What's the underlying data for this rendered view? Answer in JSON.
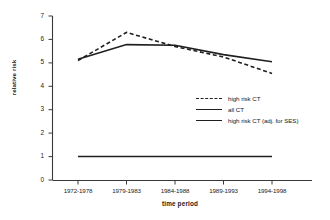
{
  "chart_data": {
    "type": "line",
    "title": "",
    "xlabel": "time period",
    "ylabel": "relative risk",
    "categories": [
      "1972-1978",
      "1979-1983",
      "1984-1988",
      "1989-1993",
      "1994-1998"
    ],
    "ylim": [
      0,
      7
    ],
    "yticks": [
      0,
      1,
      2,
      3,
      4,
      5,
      6,
      7
    ],
    "grid": false,
    "legend_position": "center-right",
    "series": [
      {
        "name": "high risk CT",
        "style": "dashed",
        "color": "#1f1f1f",
        "values": [
          5.1,
          6.3,
          5.7,
          5.25,
          4.55
        ]
      },
      {
        "name": "all CT",
        "style": "solid",
        "color": "#1f1f1f",
        "values": [
          5.15,
          5.78,
          5.75,
          5.35,
          5.05
        ]
      },
      {
        "name": "high risk CT (adj. for SES)",
        "style": "solid",
        "color": "#1f1f1f",
        "values": [
          1.0,
          1.0,
          1.0,
          1.0,
          1.0
        ]
      }
    ]
  },
  "axes": {
    "y_tick_labels": [
      "7",
      "6",
      "5",
      "4",
      "3",
      "2",
      "1",
      "0"
    ],
    "x_tick_labels": [
      "1972-1978",
      "1979-1983",
      "1984-1988",
      "1989-1993",
      "1994-1998"
    ],
    "y_axis_title": "relative risk",
    "x_axis_title": "time period"
  },
  "legend": {
    "items": [
      {
        "label": "high risk CT"
      },
      {
        "label": "all CT"
      },
      {
        "label": "high risk CT (adj. for SES)"
      }
    ]
  },
  "colors": {
    "line": "#1f1f1f",
    "axis": "#3a3a3a",
    "background": "#ffffff"
  }
}
